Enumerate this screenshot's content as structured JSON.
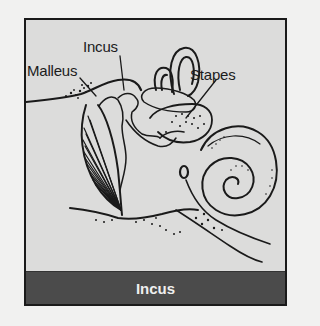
{
  "figure": {
    "labels": [
      {
        "id": "malleus",
        "text": "Malleus"
      },
      {
        "id": "incus",
        "text": "Incus"
      },
      {
        "id": "stapes",
        "text": "Stapes"
      }
    ],
    "caption": "Incus",
    "colors": {
      "background": "#dcdcdb",
      "stroke": "#1a1a1a",
      "caption_bar": "#4b4b4b",
      "caption_text": "#efefef"
    }
  }
}
